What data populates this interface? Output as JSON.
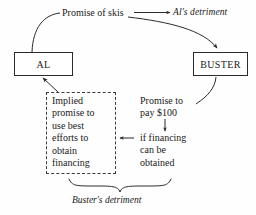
{
  "diagram": {
    "background_color": "#fefefe",
    "ink_color": "#1a1a1a",
    "nodes": [
      {
        "id": "al",
        "label": "AL"
      },
      {
        "id": "buster",
        "label": "BUSTER"
      }
    ],
    "labels": {
      "promise_of_skis": "Promise of skis",
      "al_detriment": "Al's detriment",
      "implied_promise": "Implied\npromise to\nuse best\nefforts to\nobtain\nfinancing",
      "promise_to_pay": "Promise to\npay $100",
      "if_financing": "if financing\ncan be\nobtained",
      "buster_detriment": "Buster's detriment"
    },
    "connectors": [
      {
        "id": "skis-to-al",
        "kind": "curve",
        "from": "promise-of-skis-label",
        "to": "al-box-top",
        "arrowhead": false
      },
      {
        "id": "skis-to-detriment",
        "kind": "straight",
        "from": "promise-of-skis-label",
        "to": "al-detriment-label",
        "arrowhead": true
      },
      {
        "id": "detriment-to-buster",
        "kind": "curve",
        "from": "al-detriment-label",
        "to": "buster-box-top",
        "arrowhead": true
      },
      {
        "id": "implied-to-al",
        "kind": "straight",
        "from": "dashed-box-corner",
        "to": "al-box-bottom",
        "arrowhead": true
      },
      {
        "id": "buster-to-promise-pay",
        "kind": "curve",
        "from": "buster-box-bottom",
        "to": "promise-to-pay-label",
        "arrowhead": false
      },
      {
        "id": "pay-to-condition",
        "kind": "straight",
        "from": "promise-to-pay-label",
        "to": "if-financing-label",
        "arrowhead": true
      },
      {
        "id": "condition-to-implied",
        "kind": "straight",
        "from": "if-financing-label",
        "to": "dashed-box-right",
        "arrowhead": true
      },
      {
        "id": "bottom-brace",
        "kind": "brace",
        "from": "dashed-box",
        "to": "if-financing-label",
        "arrowhead": false
      }
    ]
  }
}
